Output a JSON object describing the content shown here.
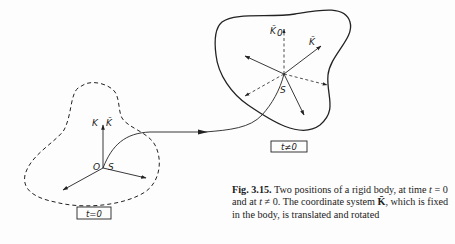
{
  "figure": {
    "labels": {
      "origin": "O",
      "K": "K",
      "K_bar_initial": "K̄",
      "S_initial": "S",
      "K0_bar": "K̄",
      "K0_sub": "0",
      "K_bar_moved": "K̄",
      "S_moved": "S"
    },
    "boxes": {
      "initial": "t=0",
      "moved": "t≠0"
    }
  },
  "caption": {
    "fig_number": "Fig. 3.15.",
    "text_part1": " Two positions of a rigid body, at time ",
    "t1": "t",
    "eq1": " = 0 and at ",
    "t2": "t",
    "eq2": " ≠ 0. The coordinate system ",
    "kbar": "K̄",
    "text_part2": ", which is fixed in the body, is translated and rotated"
  }
}
